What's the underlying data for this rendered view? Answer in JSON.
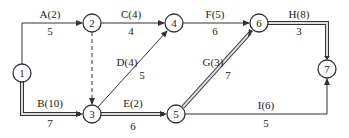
{
  "diagram": {
    "type": "activity-on-arrow network",
    "colors": {
      "line": "#333333",
      "critical_fill": "#dddddd",
      "node_fill": "#ffffff"
    },
    "nodes": [
      {
        "id": "1",
        "label": "1",
        "x": 22,
        "y": 73
      },
      {
        "id": "2",
        "label": "2",
        "x": 92,
        "y": 23
      },
      {
        "id": "3",
        "label": "3",
        "x": 92,
        "y": 114
      },
      {
        "id": "4",
        "label": "4",
        "x": 174,
        "y": 23
      },
      {
        "id": "5",
        "label": "5",
        "x": 176,
        "y": 114
      },
      {
        "id": "6",
        "label": "6",
        "x": 259,
        "y": 23
      },
      {
        "id": "7",
        "label": "7",
        "x": 327,
        "y": 69
      }
    ],
    "edges": [
      {
        "id": "A",
        "from": "1",
        "to": "2",
        "activity": "A(2)",
        "duration": "5",
        "style": "normal"
      },
      {
        "id": "B",
        "from": "1",
        "to": "3",
        "activity": "B(10)",
        "duration": "7",
        "style": "critical"
      },
      {
        "id": "C",
        "from": "2",
        "to": "4",
        "activity": "C(4)",
        "duration": "4",
        "style": "normal"
      },
      {
        "id": "dummy",
        "from": "2",
        "to": "3",
        "activity": "",
        "duration": "",
        "style": "dashed"
      },
      {
        "id": "D",
        "from": "3",
        "to": "4",
        "activity": "D(4)",
        "duration": "5",
        "style": "normal"
      },
      {
        "id": "E",
        "from": "3",
        "to": "5",
        "activity": "E(2)",
        "duration": "6",
        "style": "critical"
      },
      {
        "id": "F",
        "from": "4",
        "to": "6",
        "activity": "F(5)",
        "duration": "6",
        "style": "normal"
      },
      {
        "id": "G",
        "from": "5",
        "to": "6",
        "activity": "G(3)",
        "duration": "7",
        "style": "critical"
      },
      {
        "id": "H",
        "from": "6",
        "to": "7",
        "activity": "H(8)",
        "duration": "3",
        "style": "critical"
      },
      {
        "id": "I",
        "from": "5",
        "to": "7",
        "activity": "I(6)",
        "duration": "5",
        "style": "normal"
      }
    ]
  }
}
